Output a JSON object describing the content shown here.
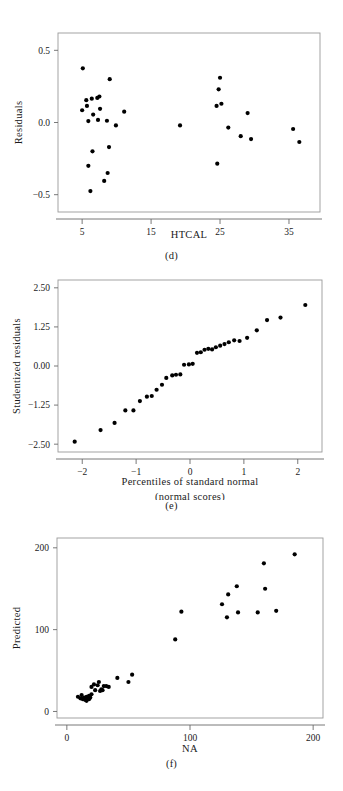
{
  "page": {
    "kind": "statistics-figure-page",
    "background": "#ffffff",
    "ink": "#1a1a1a",
    "frame_color": "#9a9a9a",
    "point_color": "#000000"
  },
  "panels": [
    {
      "id": "d",
      "caption": "(d)"
    },
    {
      "id": "e",
      "caption": "(e)"
    },
    {
      "id": "f",
      "caption": "(f)"
    }
  ],
  "chart_data": [
    {
      "panel": "d",
      "type": "scatter",
      "title": "",
      "xlabel": "HTCAL",
      "ylabel": "Residuals",
      "xlim": [
        1.5,
        39.5
      ],
      "ylim": [
        -0.62,
        0.62
      ],
      "xticks": [
        5,
        15,
        25,
        35
      ],
      "yticks": [
        -0.5,
        0.0,
        0.5
      ],
      "xtick_labels": [
        "5",
        "15",
        "25",
        "35"
      ],
      "ytick_labels": [
        "-0.5",
        "0.0",
        "0.5"
      ],
      "grid": false,
      "legend": "none",
      "points": [
        [
          5.1,
          0.375
        ],
        [
          5.0,
          0.085
        ],
        [
          5.6,
          0.155
        ],
        [
          5.7,
          0.115
        ],
        [
          5.9,
          0.01
        ],
        [
          6.4,
          0.165
        ],
        [
          7.2,
          0.17
        ],
        [
          7.5,
          0.18
        ],
        [
          7.6,
          0.095
        ],
        [
          7.3,
          0.018
        ],
        [
          6.6,
          0.055
        ],
        [
          8.6,
          0.012
        ],
        [
          9.0,
          0.3
        ],
        [
          9.9,
          -0.02
        ],
        [
          11.1,
          0.075
        ],
        [
          6.5,
          -0.2
        ],
        [
          5.9,
          -0.3
        ],
        [
          6.2,
          -0.475
        ],
        [
          8.2,
          -0.405
        ],
        [
          8.7,
          -0.35
        ],
        [
          8.9,
          -0.17
        ],
        [
          19.2,
          -0.02
        ],
        [
          24.5,
          0.115
        ],
        [
          24.8,
          0.23
        ],
        [
          25.0,
          0.31
        ],
        [
          25.2,
          0.13
        ],
        [
          24.6,
          -0.285
        ],
        [
          26.2,
          -0.035
        ],
        [
          28.0,
          -0.095
        ],
        [
          29.5,
          -0.115
        ],
        [
          29.0,
          0.065
        ],
        [
          35.6,
          -0.045
        ],
        [
          36.5,
          -0.135
        ]
      ]
    },
    {
      "panel": "e",
      "type": "scatter",
      "title": "",
      "xlabel": "Percentiles of standard normal",
      "xlabel2": "(normal scores)",
      "ylabel": "Studentized residuals",
      "xlim": [
        -2.45,
        2.45
      ],
      "ylim": [
        -2.75,
        2.75
      ],
      "xticks": [
        -2,
        -1,
        0,
        1,
        2
      ],
      "yticks": [
        -2.5,
        -1.25,
        0.0,
        1.25,
        2.5
      ],
      "xtick_labels": [
        "-2",
        "-1",
        "0",
        "1",
        "2"
      ],
      "ytick_labels": [
        "-2.50",
        "-1.25",
        "0.00",
        "1.25",
        "2.50"
      ],
      "grid": false,
      "legend": "none",
      "points": [
        [
          -2.14,
          -2.42
        ],
        [
          -1.66,
          -2.05
        ],
        [
          -1.4,
          -1.82
        ],
        [
          -1.2,
          -1.42
        ],
        [
          -1.05,
          -1.42
        ],
        [
          -0.93,
          -1.12
        ],
        [
          -0.8,
          -0.98
        ],
        [
          -0.71,
          -0.96
        ],
        [
          -0.62,
          -0.76
        ],
        [
          -0.52,
          -0.6
        ],
        [
          -0.44,
          -0.38
        ],
        [
          -0.33,
          -0.3
        ],
        [
          -0.26,
          -0.28
        ],
        [
          -0.18,
          -0.27
        ],
        [
          -0.11,
          0.04
        ],
        [
          -0.02,
          0.05
        ],
        [
          0.05,
          0.07
        ],
        [
          0.13,
          0.42
        ],
        [
          0.2,
          0.44
        ],
        [
          0.27,
          0.52
        ],
        [
          0.34,
          0.55
        ],
        [
          0.41,
          0.53
        ],
        [
          0.48,
          0.6
        ],
        [
          0.56,
          0.65
        ],
        [
          0.64,
          0.7
        ],
        [
          0.72,
          0.76
        ],
        [
          0.82,
          0.82
        ],
        [
          0.92,
          0.8
        ],
        [
          1.06,
          0.9
        ],
        [
          1.24,
          1.14
        ],
        [
          1.43,
          1.47
        ],
        [
          1.68,
          1.55
        ],
        [
          2.14,
          1.95
        ]
      ]
    },
    {
      "panel": "f",
      "type": "scatter",
      "title": "",
      "xlabel": "NA",
      "ylabel": "Predicted",
      "xlim": [
        -8,
        208
      ],
      "ylim": [
        -8,
        212
      ],
      "xticks": [
        0,
        100,
        200
      ],
      "yticks": [
        0,
        100,
        200
      ],
      "xtick_labels": [
        "0",
        "100",
        "200"
      ],
      "ytick_labels": [
        "0",
        "100",
        "200"
      ],
      "grid": false,
      "legend": "none",
      "points": [
        [
          9,
          18
        ],
        [
          11,
          16
        ],
        [
          12,
          20
        ],
        [
          13,
          15
        ],
        [
          14,
          17
        ],
        [
          15,
          14
        ],
        [
          16,
          18
        ],
        [
          16,
          13
        ],
        [
          17,
          16
        ],
        [
          18,
          15
        ],
        [
          18,
          19
        ],
        [
          19,
          17
        ],
        [
          20,
          21
        ],
        [
          20,
          30
        ],
        [
          22,
          33
        ],
        [
          23,
          26
        ],
        [
          25,
          32
        ],
        [
          26,
          36
        ],
        [
          27,
          25
        ],
        [
          28,
          27
        ],
        [
          29,
          26
        ],
        [
          30,
          31
        ],
        [
          32,
          31
        ],
        [
          34,
          30
        ],
        [
          41,
          41
        ],
        [
          50,
          36
        ],
        [
          53,
          45
        ],
        [
          88,
          88
        ],
        [
          93,
          122
        ],
        [
          126,
          131
        ],
        [
          130,
          115
        ],
        [
          131,
          143
        ],
        [
          138,
          153
        ],
        [
          139,
          121
        ],
        [
          155,
          121
        ],
        [
          160,
          181
        ],
        [
          161,
          150
        ],
        [
          170,
          123
        ],
        [
          185,
          192
        ]
      ]
    }
  ]
}
